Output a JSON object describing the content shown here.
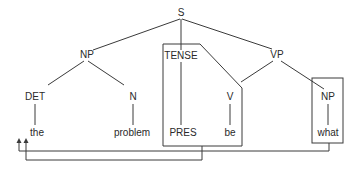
{
  "diagram": {
    "type": "syntax-tree",
    "nodes": {
      "s": "S",
      "np_subject": "NP",
      "det": "DET",
      "n": "N",
      "tense": "TENSE",
      "vp": "VP",
      "v": "V",
      "np_object": "NP"
    },
    "words": {
      "the": "the",
      "problem": "problem",
      "pres": "PRES",
      "be": "be",
      "what": "what"
    },
    "boxes": [
      "TENSE-PRES / be",
      "NP-what"
    ],
    "arrows": [
      {
        "from": "what",
        "to": "sentence-initial position (left)"
      },
      {
        "from": "PRES",
        "to": "sentence-initial position (right)"
      }
    ],
    "colors": {
      "line": "#3a3a3a",
      "text": "#2a2a2a",
      "background": "#ffffff"
    }
  }
}
